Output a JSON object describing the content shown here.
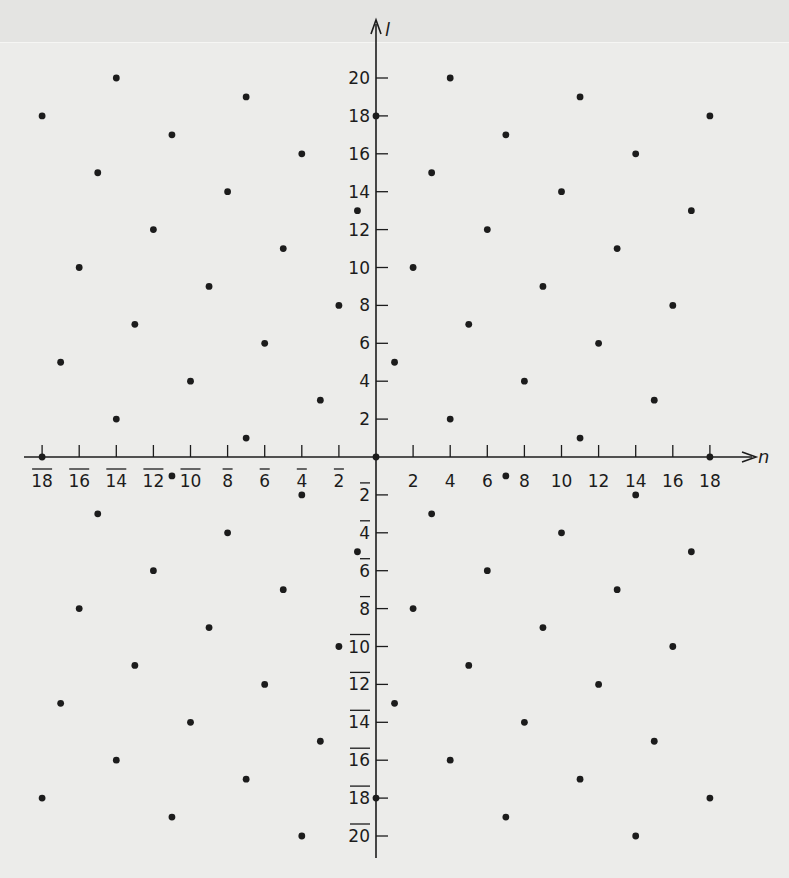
{
  "chart_data": {
    "type": "scatter",
    "title": "",
    "xlabel": "n",
    "ylabel": "l",
    "xlim": [
      -18,
      18
    ],
    "ylim": [
      -20,
      20
    ],
    "grid": false,
    "legend": null,
    "x_ticks": [
      -18,
      -16,
      -14,
      -12,
      -10,
      -8,
      -6,
      -4,
      -2,
      2,
      4,
      6,
      8,
      10,
      12,
      14,
      16,
      18
    ],
    "y_ticks": [
      -20,
      -18,
      -16,
      -14,
      -12,
      -10,
      -8,
      -6,
      -4,
      -2,
      2,
      4,
      6,
      8,
      10,
      12,
      14,
      16,
      18,
      20
    ],
    "negative_label_style": "overbar",
    "points": [
      [
        -18,
        18
      ],
      [
        -14,
        20
      ],
      [
        -7,
        19
      ],
      [
        -11,
        17
      ],
      [
        -4,
        16
      ],
      [
        -15,
        15
      ],
      [
        -8,
        14
      ],
      [
        -1,
        13
      ],
      [
        -12,
        12
      ],
      [
        -5,
        11
      ],
      [
        -16,
        10
      ],
      [
        -9,
        9
      ],
      [
        -2,
        8
      ],
      [
        -13,
        7
      ],
      [
        -6,
        6
      ],
      [
        -17,
        5
      ],
      [
        -10,
        4
      ],
      [
        -3,
        3
      ],
      [
        -14,
        2
      ],
      [
        -7,
        1
      ],
      [
        0,
        18
      ],
      [
        1,
        5
      ],
      [
        2,
        10
      ],
      [
        3,
        15
      ],
      [
        4,
        20
      ],
      [
        4,
        2
      ],
      [
        5,
        7
      ],
      [
        6,
        12
      ],
      [
        7,
        17
      ],
      [
        8,
        4
      ],
      [
        9,
        9
      ],
      [
        10,
        14
      ],
      [
        11,
        19
      ],
      [
        11,
        1
      ],
      [
        12,
        6
      ],
      [
        13,
        11
      ],
      [
        14,
        16
      ],
      [
        15,
        3
      ],
      [
        16,
        8
      ],
      [
        17,
        13
      ],
      [
        18,
        18
      ],
      [
        -18,
        0
      ],
      [
        0,
        0
      ],
      [
        18,
        0
      ],
      [
        -11,
        -1
      ],
      [
        7,
        -1
      ],
      [
        -4,
        -2
      ],
      [
        -15,
        -3
      ],
      [
        -8,
        -4
      ],
      [
        -1,
        -5
      ],
      [
        -12,
        -6
      ],
      [
        -5,
        -7
      ],
      [
        -16,
        -8
      ],
      [
        -9,
        -9
      ],
      [
        -2,
        -10
      ],
      [
        -13,
        -11
      ],
      [
        -6,
        -12
      ],
      [
        -17,
        -13
      ],
      [
        -10,
        -14
      ],
      [
        -3,
        -15
      ],
      [
        -14,
        -16
      ],
      [
        -7,
        -17
      ],
      [
        -18,
        -18
      ],
      [
        -11,
        -19
      ],
      [
        -4,
        -20
      ],
      [
        0,
        -18
      ],
      [
        1,
        -13
      ],
      [
        2,
        -8
      ],
      [
        3,
        -3
      ],
      [
        4,
        -16
      ],
      [
        5,
        -11
      ],
      [
        6,
        -6
      ],
      [
        7,
        -19
      ],
      [
        8,
        -14
      ],
      [
        9,
        -9
      ],
      [
        10,
        -4
      ],
      [
        11,
        -17
      ],
      [
        12,
        -12
      ],
      [
        13,
        -7
      ],
      [
        14,
        -2
      ],
      [
        14,
        -20
      ],
      [
        15,
        -15
      ],
      [
        16,
        -10
      ],
      [
        17,
        -5
      ],
      [
        18,
        -18
      ]
    ]
  },
  "axes": {
    "x_label": "n",
    "y_label": "l"
  },
  "colors": {
    "background": "#ececea",
    "ink": "#1c1c1c"
  }
}
